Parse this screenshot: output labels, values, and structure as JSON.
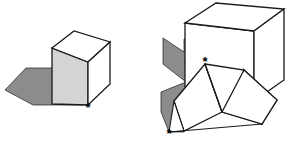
{
  "figure": {
    "background_color": "#ffffff",
    "outline_color": "#1a1a1a",
    "colors": {
      "top_face": "#ffffff",
      "front_face": "#d4d4d4",
      "side_face": "#ffffff",
      "shadow": "#8c8c8c",
      "outline": "#1a1a1a",
      "marker": "#000000"
    },
    "marker_glyph": "✱",
    "objects": [
      {
        "id": "left-figure",
        "name": "single-cube-with-shadow",
        "marker_label": "*",
        "marker_count": 1
      },
      {
        "id": "right-figure",
        "name": "cube-and-wedge-with-zigzag-shadow",
        "marker_label": "*",
        "marker_count": 2
      }
    ],
    "markers": [
      {
        "id": "left-marker",
        "label": "*",
        "x": 88,
        "y": 106
      },
      {
        "id": "right-upper-marker",
        "label": "*",
        "x": 205,
        "y": 64
      },
      {
        "id": "right-lower-marker",
        "label": "*",
        "x": 169,
        "y": 133
      }
    ]
  }
}
